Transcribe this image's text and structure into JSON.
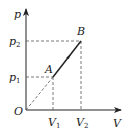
{
  "diagram": {
    "type": "p-V diagram",
    "axes": {
      "y_label": "p",
      "x_label": "V",
      "origin_label": "O"
    },
    "ticks": {
      "y": [
        {
          "base": "p",
          "sub": "2"
        },
        {
          "base": "p",
          "sub": "1"
        }
      ],
      "x": [
        {
          "base": "V",
          "sub": "1"
        },
        {
          "base": "V",
          "sub": "2"
        }
      ]
    },
    "points": [
      {
        "label": "A",
        "p": "p1",
        "V": "V1"
      },
      {
        "label": "B",
        "p": "p2",
        "V": "V2"
      }
    ],
    "process": {
      "from": "A",
      "to": "B",
      "style": "solid line with direction arrow",
      "extension_to_origin": "dashed"
    },
    "colors": {
      "line": "#222222",
      "dashed": "#555555",
      "background": "#ffffff"
    }
  }
}
